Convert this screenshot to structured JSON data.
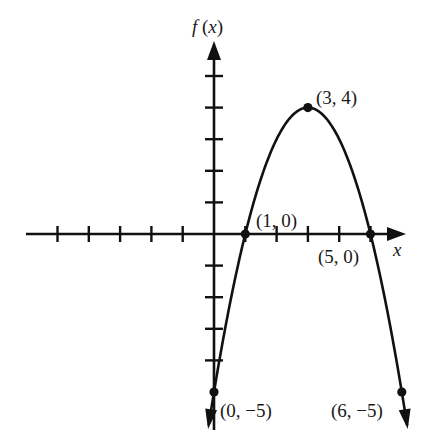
{
  "chart_data": {
    "type": "line",
    "title": "",
    "function": "f(x) = -(x - 3)^2 + 4",
    "xlabel": "x",
    "ylabel": "f (x)",
    "xlim": [
      -6,
      6.5
    ],
    "ylim": [
      -6,
      5.5
    ],
    "x_ticks": [
      -5,
      -4,
      -3,
      -2,
      -1,
      1,
      2,
      3,
      4,
      5
    ],
    "y_ticks": [
      -4,
      -3,
      -2,
      -1,
      1,
      2,
      3,
      4,
      5
    ],
    "grid": false,
    "legend": null,
    "series": [
      {
        "name": "f(x)",
        "x": [
          0,
          1,
          2,
          3,
          4,
          5,
          6
        ],
        "values": [
          -5,
          0,
          3,
          4,
          3,
          0,
          -5
        ]
      }
    ],
    "marked_points": [
      {
        "x": 3,
        "y": 4,
        "label": "(3, 4)"
      },
      {
        "x": 1,
        "y": 0,
        "label": "(1, 0)"
      },
      {
        "x": 5,
        "y": 0,
        "label": "(5, 0)"
      },
      {
        "x": 0,
        "y": -5,
        "label": "(0, −5)"
      },
      {
        "x": 6,
        "y": -5,
        "label": "(6, −5)"
      }
    ],
    "annotations": [
      "(3, 4)",
      "(1, 0)",
      "(5, 0)",
      "(0, −5)",
      "(6, −5)"
    ]
  },
  "labels": {
    "y_axis": "f (x)",
    "x_axis": "x",
    "vertex": "(3, 4)",
    "root_left": "(1, 0)",
    "root_right": "(5, 0)",
    "y_intercept": "(0, −5)",
    "end_right": "(6, −5)"
  }
}
